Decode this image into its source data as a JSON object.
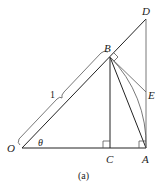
{
  "figure": {
    "caption": "(a)",
    "points": {
      "O": {
        "label": "O",
        "x": 22,
        "y": 148
      },
      "C": {
        "label": "C",
        "x": 110,
        "y": 148
      },
      "A": {
        "label": "A",
        "x": 146,
        "y": 148
      },
      "B": {
        "label": "B",
        "x": 110,
        "y": 57
      },
      "D": {
        "label": "D",
        "x": 146,
        "y": 19
      },
      "E": {
        "label": "E",
        "x": 146,
        "y": 92
      }
    },
    "labels": {
      "length_OB": "1",
      "angle": "θ"
    },
    "segments": [
      "O-D",
      "O-A",
      "B-C",
      "B-A",
      "D-A",
      "B-E",
      "arc B-A"
    ],
    "right_angles": [
      "C",
      "A",
      "B"
    ]
  }
}
